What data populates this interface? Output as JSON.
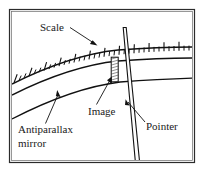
{
  "figure": {
    "background_color": "#ffffff",
    "ink_color": "#111111",
    "frame": {
      "outer_color": "#2b2b2b",
      "inner_color": "#6b6b6b",
      "x": 9,
      "y": 9,
      "width": 186,
      "height": 154
    },
    "labels": [
      {
        "id": "scale",
        "text": "Scale",
        "x": 40,
        "y": 31,
        "font_size": 11
      },
      {
        "id": "image",
        "text": "Image",
        "x": 88,
        "y": 112,
        "font_size": 11
      },
      {
        "id": "pointer",
        "text": "Pointer",
        "x": 146,
        "y": 128,
        "font_size": 11
      },
      {
        "id": "antiparallax-mirror-line1",
        "text": "Antiparallax",
        "x": 18,
        "y": 131,
        "font_size": 11
      },
      {
        "id": "antiparallax-mirror-line2",
        "text": "mirror",
        "x": 18,
        "y": 145,
        "font_size": 11
      }
    ],
    "leaders": [
      {
        "id": "scale-leader",
        "from_x": 70,
        "from_y": 28,
        "to_x": 96,
        "to_y": 45
      },
      {
        "id": "image-leader",
        "from_x": 104,
        "from_y": 103,
        "to_x": 112,
        "to_y": 78
      },
      {
        "id": "pointer-leader",
        "from_x": 144,
        "from_y": 122,
        "to_x": 126,
        "to_y": 101
      },
      {
        "id": "mirror-leader",
        "from_x": 45,
        "from_y": 124,
        "to_x": 58,
        "to_y": 92
      }
    ],
    "scale_arc": {
      "description": "graduated scale arc with alternating long and short tick marks",
      "tick_count": 33,
      "long_tick_every": 3,
      "long_tick_length": 9,
      "short_tick_length": 5
    },
    "mirror_band": {
      "description": "antiparallax mirror strip between two concentric arcs"
    },
    "pointer": {
      "description": "tapered needle crossing the scale",
      "top_x": 124,
      "top_y": 27,
      "bottom_x": 139,
      "bottom_y": 171
    },
    "image_bar": {
      "description": "cross-hatched reflected image of the pointer in the mirror",
      "x": 111,
      "y": 57,
      "width": 7,
      "height": 25,
      "hatch_count": 9
    }
  }
}
